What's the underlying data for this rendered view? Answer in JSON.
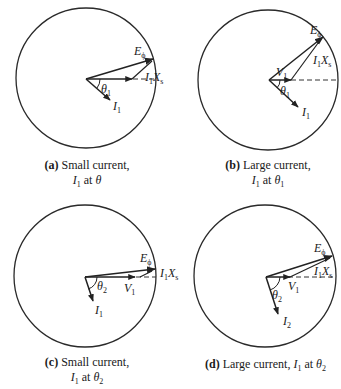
{
  "figure": {
    "panels": [
      {
        "id": "a",
        "tag": "(a)",
        "caption_line1": "Small current,",
        "caption_line2_var": "I",
        "caption_line2_var_sub": "1",
        "caption_line2_mid": " at ",
        "caption_line2_angle": "θ",
        "caption_line2_angle_sub": "",
        "labels": {
          "E": "E",
          "E_sub": "ϕ",
          "IX": "I",
          "IX_sub1": "1",
          "IX_X": "X",
          "IX_sub2": "s",
          "theta": "θ",
          "theta_sub": "1",
          "I": "I",
          "I_sub": "1",
          "V": "",
          "V_sub": ""
        }
      },
      {
        "id": "b",
        "tag": "(b)",
        "caption_line1": "Large current,",
        "caption_line2_var": "I",
        "caption_line2_var_sub": "1",
        "caption_line2_mid": " at ",
        "caption_line2_angle": "θ",
        "caption_line2_angle_sub": "1",
        "labels": {
          "E": "E",
          "E_sub": "ϕ",
          "IX": "I",
          "IX_sub1": "1",
          "IX_X": "X",
          "IX_sub2": "s",
          "theta": "θ",
          "theta_sub": "1",
          "I": "I",
          "I_sub": "1",
          "V": "V",
          "V_sub": "1"
        }
      },
      {
        "id": "c",
        "tag": "(c)",
        "caption_line1": "Small current,",
        "caption_line2_var": "I",
        "caption_line2_var_sub": "1",
        "caption_line2_mid": " at ",
        "caption_line2_angle": "θ",
        "caption_line2_angle_sub": "2",
        "labels": {
          "E": "E",
          "E_sub": "ϕ",
          "IX": "I",
          "IX_sub1": "1",
          "IX_X": "X",
          "IX_sub2": "s",
          "theta": "θ",
          "theta_sub": "2",
          "I": "I",
          "I_sub": "1",
          "V": "V",
          "V_sub": "1"
        }
      },
      {
        "id": "d",
        "tag": "(d)",
        "caption_line1": "Large current, ",
        "caption_line2_var": "I",
        "caption_line2_var_sub": "1",
        "caption_line2_mid": " at ",
        "caption_line2_angle": "θ",
        "caption_line2_angle_sub": "2",
        "labels": {
          "E": "E",
          "E_sub": "ϕ",
          "IX": "I",
          "IX_sub1": "1",
          "IX_X": "X",
          "IX_sub2": "s",
          "theta": "θ",
          "theta_sub": "2",
          "I": "I",
          "I_sub": "2",
          "V": "V",
          "V_sub": "1"
        }
      }
    ]
  }
}
